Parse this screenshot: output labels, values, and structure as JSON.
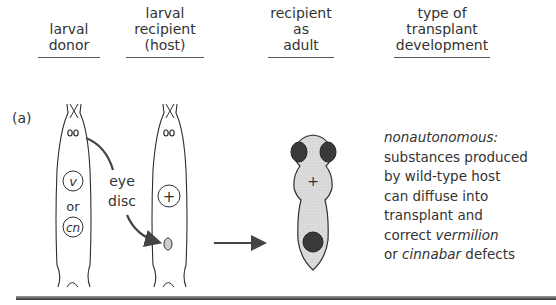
{
  "headers": [
    {
      "id": "donor",
      "lines": [
        "larval",
        "donor"
      ]
    },
    {
      "id": "recipient",
      "lines": [
        "larval",
        "recipient",
        "(host)"
      ]
    },
    {
      "id": "adult",
      "lines": [
        "recipient",
        "as",
        "adult"
      ]
    },
    {
      "id": "type",
      "lines": [
        "type of",
        "transplant",
        "development"
      ]
    }
  ],
  "row_label": "(a)",
  "donor": {
    "genotype_1": "v",
    "connector": "or",
    "genotype_2": "cn"
  },
  "host": {
    "genotype": "+"
  },
  "eye_disc_label": [
    "eye",
    "disc"
  ],
  "adult": {
    "genotype": "+"
  },
  "description": {
    "title": "nonautonomous:",
    "line1": "substances produced",
    "line2": "by wild-type host",
    "line3": "can diffuse into",
    "line4": "transplant and",
    "line5_pre": "correct ",
    "line5_it": "vermilion",
    "line6_pre": "or ",
    "line6_it": "cinnabar",
    "line6_post": " defects"
  },
  "colors": {
    "outline": "#2e2e2e",
    "body_fill": "#d9d9d9",
    "eye_fill": "#3a3a3a",
    "arrow": "#444444"
  }
}
